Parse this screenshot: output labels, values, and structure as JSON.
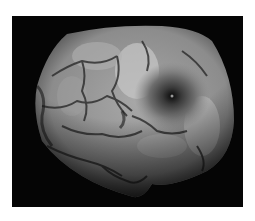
{
  "image": {
    "subject": "grayscale fundus photograph",
    "background_color": "#ffffff",
    "frame_color": "#050505",
    "fundus_base_color": "#8a8a8a",
    "highlight_color": "#d8d8d8",
    "macula_color": "#111111"
  }
}
